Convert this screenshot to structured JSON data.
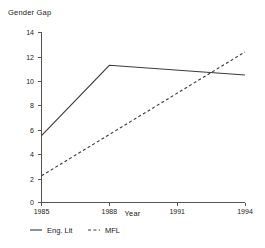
{
  "chart_data": {
    "type": "line",
    "title": "",
    "ylabel": "Gender Gap",
    "xlabel": "Year",
    "x": [
      1985,
      1988,
      1994
    ],
    "xlim": [
      1985,
      1994
    ],
    "ylim": [
      0,
      14
    ],
    "xticks": [
      "1985",
      "1988",
      "1991",
      "1994"
    ],
    "xtick_values": [
      1985,
      1988,
      1991,
      1994
    ],
    "yticks": [
      "0",
      "2",
      "4",
      "6",
      "8",
      "10",
      "12",
      "14"
    ],
    "ytick_values": [
      0,
      2,
      4,
      6,
      8,
      10,
      12,
      14
    ],
    "grid": false,
    "legend_position": "below",
    "series": [
      {
        "name": "Eng. Lit",
        "style": "solid",
        "color": "#3a3a3a",
        "x": [
          1985,
          1988,
          1994
        ],
        "values": [
          5.5,
          11.3,
          10.5
        ]
      },
      {
        "name": "MFL",
        "style": "dashed",
        "color": "#3a3a3a",
        "x": [
          1985,
          1994
        ],
        "values": [
          2.2,
          12.4
        ]
      }
    ]
  },
  "legend": {
    "items": [
      {
        "label": "Eng. Lit",
        "style": "solid"
      },
      {
        "label": "MFL",
        "style": "dashed"
      }
    ]
  },
  "axis": {
    "y_title": "Gender Gap",
    "x_title": "Year"
  }
}
